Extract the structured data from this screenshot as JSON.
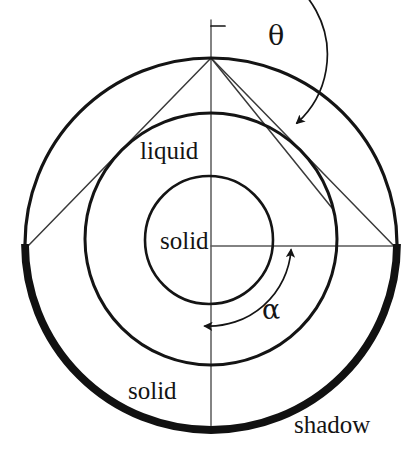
{
  "figure": {
    "type": "diagram",
    "background_color": "#ffffff",
    "stroke_color": "#141414",
    "width": 412,
    "height": 456
  },
  "labels": {
    "liquid": "liquid",
    "solid_core": "solid",
    "solid_shell": "solid",
    "shadow": "shadow",
    "theta": "θ",
    "alpha": "α"
  },
  "geometry": {
    "outer_circle": {
      "name": "outer-boundary",
      "cx": 211,
      "cy": 244,
      "r": 186,
      "stroke_width": 3.2
    },
    "liquid_circle": {
      "name": "liquid-boundary",
      "cx": 211,
      "cy": 239,
      "r": 126,
      "stroke_width": 3.0
    },
    "solid_circle": {
      "name": "solid-core-boundary",
      "cx": 209,
      "cy": 240,
      "r": 64,
      "stroke_width": 2.6
    },
    "shadow_arc": {
      "name": "shadow-arc",
      "start_angle_deg": 180,
      "end_angle_deg": 360,
      "stroke_width": 7.5,
      "description": "thick arc on lower half of outer circle from left vertex through bottom to right vertex"
    },
    "apex_point": {
      "x": 211,
      "y": 58
    },
    "left_vertex": {
      "x": 28,
      "y": 246
    },
    "right_vertex": {
      "x": 394,
      "y": 246
    },
    "center_point": {
      "x": 211,
      "y": 244
    }
  },
  "annotations": {
    "theta_arc": {
      "name": "theta-angle-arc",
      "vertex": {
        "x": 211,
        "y": 58
      },
      "radius": 92,
      "from_deg": -90,
      "to_deg": -22,
      "arrow_at": "end",
      "description": "angle measured clockwise from the upward vertical at the apex"
    },
    "alpha_arc": {
      "name": "alpha-angle-arc",
      "vertex": {
        "x": 211,
        "y": 244
      },
      "radius": 82,
      "from_deg": 0,
      "to_deg": 90,
      "arrow_at": "both",
      "description": "angle measured from the rightward horizontal radius around to the downward vertical radius"
    },
    "vertical_axis": {
      "name": "vertical-axis-line",
      "x": 211,
      "y_top": 20,
      "y_bottom": 430
    },
    "horizontal_radius": {
      "name": "horizontal-radius-line",
      "y": 246,
      "x_left": 211,
      "x_right": 394
    },
    "chords": [
      {
        "name": "chord-apex-to-left-vertex",
        "from": {
          "x": 211,
          "y": 58
        },
        "to": {
          "x": 28,
          "y": 246
        }
      },
      {
        "name": "chord-apex-to-right-vertex",
        "from": {
          "x": 211,
          "y": 58
        },
        "to": {
          "x": 394,
          "y": 246
        }
      },
      {
        "name": "chord-apex-to-inner-right",
        "from": {
          "x": 211,
          "y": 58
        },
        "to": {
          "x": 330,
          "y": 206
        }
      }
    ]
  }
}
